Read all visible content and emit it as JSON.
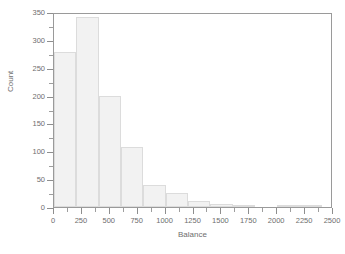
{
  "chart_data": {
    "type": "bar",
    "title": "",
    "subtitle": "",
    "xlabel": "Balance",
    "ylabel": "Count",
    "xlim": [
      0,
      2500
    ],
    "ylim": [
      0,
      350
    ],
    "grid": false,
    "legend": null,
    "bin_width": 200,
    "bin_edges": [
      0,
      200,
      400,
      600,
      800,
      1000,
      1200,
      1400,
      1600,
      1800,
      2000,
      2200,
      2400
    ],
    "categories": [
      "0-200",
      "200-400",
      "400-600",
      "600-800",
      "800-1000",
      "1000-1200",
      "1200-1400",
      "1400-1600",
      "1600-1800",
      "1800-2000",
      "2000-2200",
      "2200-2400"
    ],
    "values": [
      279,
      341,
      199,
      108,
      39,
      26,
      11,
      6,
      3,
      0,
      2,
      2
    ],
    "xticks": [
      0,
      250,
      500,
      750,
      1000,
      1250,
      1500,
      1750,
      2000,
      2250,
      2500
    ],
    "xtick_labels": [
      "0",
      "250",
      "500",
      "750",
      "1000",
      "1250",
      "1500",
      "1750",
      "2000",
      "2250",
      "2500"
    ],
    "yticks": [
      0,
      50,
      100,
      150,
      200,
      250,
      300,
      350
    ],
    "ytick_labels": [
      "0",
      "50",
      "100",
      "150",
      "200",
      "250",
      "300",
      "350"
    ],
    "bar_fill_color": "#f2f2f2",
    "bar_edge_color": "#dcdcdc",
    "axis_color": "#9a9a9a",
    "text_color": "#6e6e6e",
    "background_color": "#ffffff"
  },
  "axes": {
    "x_title": "Balance",
    "y_title": "Count"
  }
}
